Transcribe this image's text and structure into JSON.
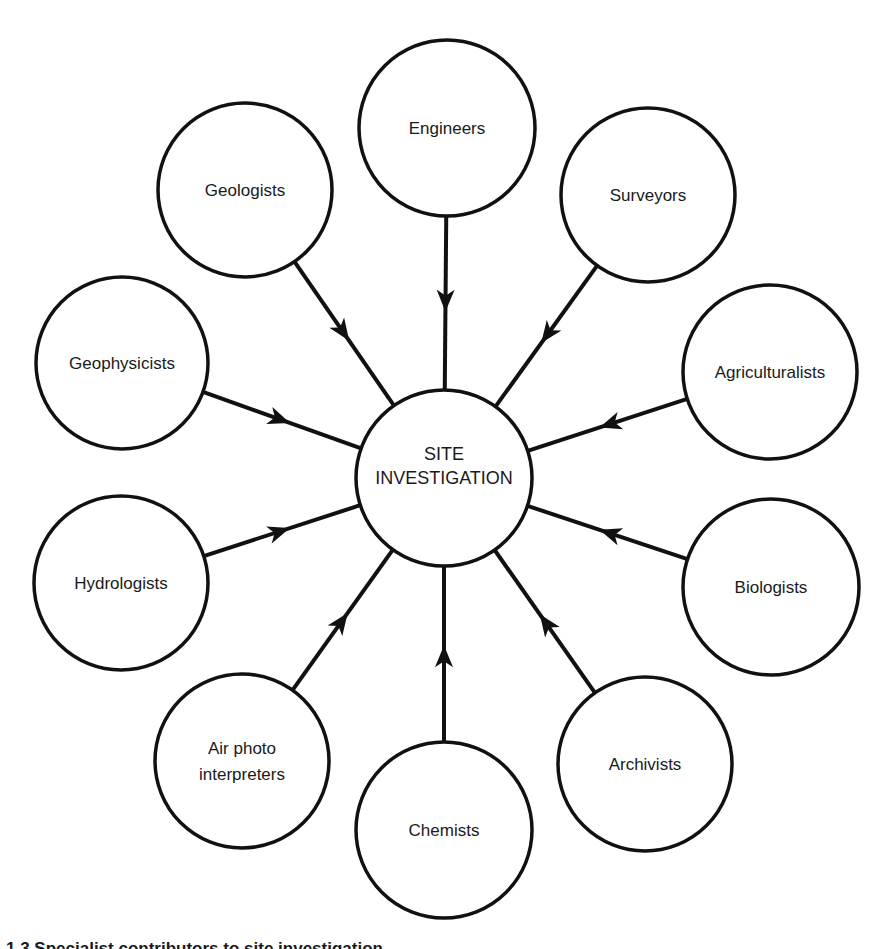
{
  "diagram": {
    "center": {
      "label_lines": [
        "SITE",
        "INVESTIGATION"
      ],
      "cx": 444,
      "cy": 478,
      "r": 88
    },
    "stroke_color": "#111111",
    "background_color": "#ffffff",
    "nodes": [
      {
        "id": "engineers",
        "label_lines": [
          "Engineers"
        ],
        "cx": 447,
        "cy": 128,
        "r": 88
      },
      {
        "id": "surveyors",
        "label_lines": [
          "Surveyors"
        ],
        "cx": 648,
        "cy": 195,
        "r": 87
      },
      {
        "id": "agriculturalists",
        "label_lines": [
          "Agriculturalists"
        ],
        "cx": 770,
        "cy": 372,
        "r": 87
      },
      {
        "id": "biologists",
        "label_lines": [
          "Biologists"
        ],
        "cx": 771,
        "cy": 587,
        "r": 88
      },
      {
        "id": "archivists",
        "label_lines": [
          "Archivists"
        ],
        "cx": 645,
        "cy": 764,
        "r": 87
      },
      {
        "id": "chemists",
        "label_lines": [
          "Chemists"
        ],
        "cx": 444,
        "cy": 830,
        "r": 88
      },
      {
        "id": "air-photo-interpreters",
        "label_lines": [
          "Air photo",
          "interpreters"
        ],
        "cx": 242,
        "cy": 761,
        "r": 87
      },
      {
        "id": "hydrologists",
        "label_lines": [
          "Hydrologists"
        ],
        "cx": 121,
        "cy": 583,
        "r": 87
      },
      {
        "id": "geophysicists",
        "label_lines": [
          "Geophysicists"
        ],
        "cx": 122,
        "cy": 363,
        "r": 86
      },
      {
        "id": "geologists",
        "label_lines": [
          "Geologists"
        ],
        "cx": 245,
        "cy": 190,
        "r": 87
      }
    ],
    "edges": [
      {
        "from": "engineers",
        "to": "center",
        "arrow": "toward-center"
      },
      {
        "from": "surveyors",
        "to": "center",
        "arrow": "toward-center"
      },
      {
        "from": "agriculturalists",
        "to": "center",
        "arrow": "toward-center"
      },
      {
        "from": "biologists",
        "to": "center",
        "arrow": "toward-center"
      },
      {
        "from": "archivists",
        "to": "center",
        "arrow": "toward-center"
      },
      {
        "from": "chemists",
        "to": "center",
        "arrow": "toward-center"
      },
      {
        "from": "air-photo-interpreters",
        "to": "center",
        "arrow": "toward-center"
      },
      {
        "from": "hydrologists",
        "to": "center",
        "arrow": "toward-center"
      },
      {
        "from": "geophysicists",
        "to": "center",
        "arrow": "toward-center"
      },
      {
        "from": "geologists",
        "to": "center",
        "arrow": "toward-center"
      }
    ]
  },
  "caption": {
    "text": "1.3  Specialist contributors to site investigation"
  }
}
